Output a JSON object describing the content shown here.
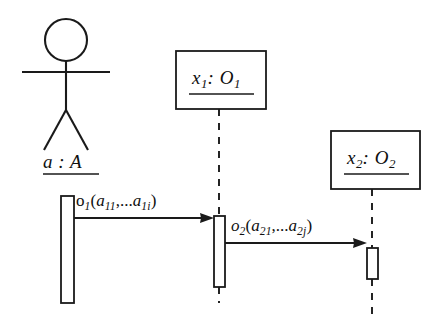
{
  "diagram": {
    "type": "uml-sequence-diagram",
    "background_color": "#ffffff",
    "line_color": "#1a1a1a",
    "actor": {
      "name": "actor-a",
      "label": "a : A",
      "label_underlined": true,
      "head_center_x": 66,
      "head_center_y": 40,
      "head_radius": 21,
      "lifeline_x": 67,
      "activation": {
        "x": 61,
        "y": 196,
        "width": 13,
        "height": 107
      }
    },
    "objects": [
      {
        "name": "object-x1",
        "label_parts": {
          "instance": "x",
          "instance_sub": "1",
          "separator": ":",
          "class": "O",
          "class_sub": "1"
        },
        "label_text": "x1: O1",
        "label_underlined": true,
        "box": {
          "x": 176,
          "y": 51,
          "width": 90,
          "height": 58
        },
        "lifeline_x": 219,
        "activation": {
          "x": 214,
          "y": 216,
          "width": 11,
          "height": 71
        }
      },
      {
        "name": "object-x2",
        "label_parts": {
          "instance": "x",
          "instance_sub": "2",
          "separator": ":",
          "class": "O",
          "class_sub": "2"
        },
        "label_text": "x2: O2",
        "label_underlined": true,
        "box": {
          "x": 331,
          "y": 131,
          "width": 89,
          "height": 58
        },
        "lifeline_x": 372,
        "activation": {
          "x": 367,
          "y": 248,
          "width": 11,
          "height": 31
        }
      }
    ],
    "messages": [
      {
        "name": "message-o1",
        "text": "o1(a11,...a1i)",
        "operation": "o",
        "operation_sub": "1",
        "args": [
          "a11",
          "...",
          "a1i"
        ],
        "from": "actor-a",
        "to": "object-x1",
        "x_start": 74,
        "x_end": 218,
        "y": 218,
        "arrowhead": "filled"
      },
      {
        "name": "message-o2",
        "text": "o2(a21,...a2j)",
        "operation": "o",
        "operation_sub": "2",
        "args": [
          "a21",
          "...",
          "a2j"
        ],
        "from": "object-x1",
        "to": "object-x2",
        "x_start": 225,
        "x_end": 370,
        "y": 243,
        "arrowhead": "filled"
      }
    ]
  }
}
